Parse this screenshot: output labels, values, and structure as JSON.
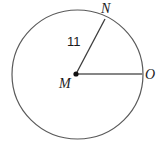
{
  "figure": {
    "kind": "circle-geometry-diagram",
    "background_color": "#ffffff",
    "canvas": {
      "width": 162,
      "height": 149
    }
  },
  "circle": {
    "name": "circle-M",
    "center_label": "M",
    "center_x": 77.5,
    "center_y": 74.5,
    "radius_x": 65.5,
    "radius_y": 64.5,
    "stroke_color": "#5a5a5a",
    "stroke_width": 1.2,
    "fill_color": "#ffffff"
  },
  "center_point": {
    "label": "M",
    "x": 76,
    "y": 74,
    "dot_radius": 2.6,
    "dot_color": "#111111"
  },
  "radii": [
    {
      "name": "radius-MN",
      "from_label": "M",
      "to_label": "N",
      "x1": 76,
      "y1": 74,
      "x2": 105,
      "y2": 19,
      "stroke_color": "#3c3c3c",
      "stroke_width": 1.3,
      "measure_label": "11"
    },
    {
      "name": "radius-MO",
      "from_label": "M",
      "to_label": "O",
      "x1": 76,
      "y1": 74,
      "x2": 143,
      "y2": 74,
      "stroke_color": "#868686",
      "stroke_width": 2.0,
      "measure_label": ""
    }
  ],
  "labels": {
    "point_n": "N",
    "point_m": "M",
    "point_o": "O",
    "radius_value": "11"
  }
}
